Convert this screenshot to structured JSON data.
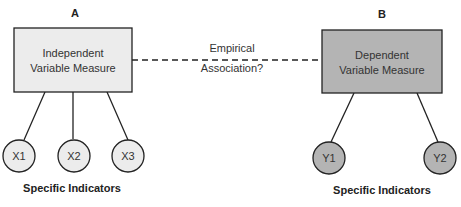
{
  "diagram": {
    "box_a": {
      "letter": "A",
      "line1": "Independent",
      "line2": "Variable Measure",
      "fill": "#ececec"
    },
    "box_b": {
      "letter": "B",
      "line1": "Dependent",
      "line2": "Variable Measure",
      "fill": "#b4b4b4"
    },
    "association": {
      "line1": "Empirical",
      "line2": "Association?"
    },
    "indicators_a": {
      "caption": "Specific Indicators",
      "fill": "#ececec",
      "items": [
        "X1",
        "X2",
        "X3"
      ]
    },
    "indicators_b": {
      "caption": "Specific Indicators",
      "fill": "#b4b4b4",
      "items": [
        "Y1",
        "Y2"
      ]
    },
    "stroke": "#222222"
  }
}
